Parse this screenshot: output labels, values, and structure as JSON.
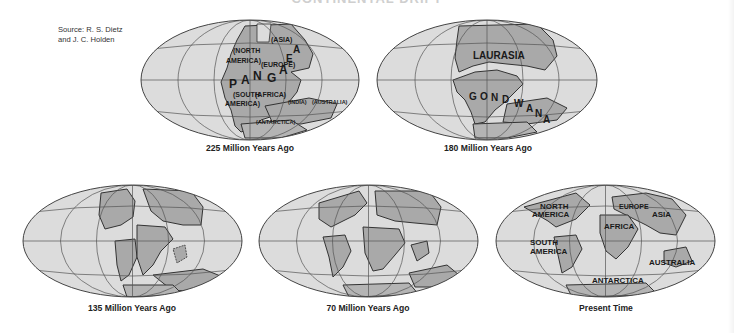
{
  "figure": {
    "title_partial": "CONTINENTAL DRIFT",
    "source": {
      "line1": "Source: R. S. Dietz",
      "line2": "and J. C. Holden"
    },
    "colors": {
      "ocean": "#dcdcdc",
      "land": "#a9a9a9",
      "grid": "#555555",
      "outline": "#333333"
    },
    "maps": [
      {
        "caption": "225 Million Years Ago",
        "labels": {
          "asia": "(ASIA)",
          "north": "(NORTH",
          "america": "AMERICA)",
          "europe": "(EUROPE)",
          "south": "(SOUTH",
          "south_america": "AMERICA)",
          "africa": "(AFRICA)",
          "india": "(INDIA)",
          "australia": "(AUSTRALIA)",
          "antarctica": "(ANTARCTICA)",
          "pangaea": [
            "P",
            "A",
            "N",
            "G",
            "A",
            "E",
            "A"
          ]
        }
      },
      {
        "caption": "180 Million Years Ago",
        "labels": {
          "laurasia": "LAURASIA",
          "gondwana": [
            "G",
            "O",
            "N",
            "D",
            "W",
            "A",
            "N",
            "A"
          ]
        }
      },
      {
        "caption": "135 Million Years Ago",
        "labels": {}
      },
      {
        "caption": "70 Million Years Ago",
        "labels": {}
      },
      {
        "caption": "Present Time",
        "labels": {
          "north": "NORTH",
          "north_america": "AMERICA",
          "europe": "EUROPE",
          "asia": "ASIA",
          "africa": "AFRICA",
          "south": "SOUTH",
          "south_america": "AMERICA",
          "australia": "AUSTRALIA",
          "antarctica": "ANTARCTICA"
        }
      }
    ]
  }
}
